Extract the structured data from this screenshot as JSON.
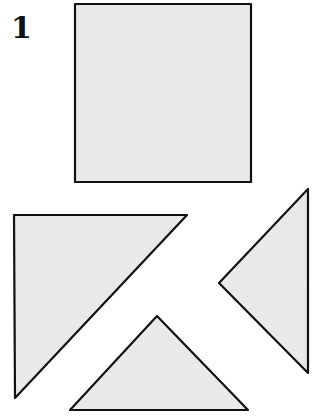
{
  "figure": {
    "label": "1",
    "fill_color": "#e9e9e9",
    "stroke_color": "#111111",
    "pieces": [
      {
        "name": "square",
        "points": "75,4 251,4 251,182 75,182"
      },
      {
        "name": "large-triangle",
        "points": "14,215 187,215 15,398"
      },
      {
        "name": "right-triangle",
        "points": "308,189 308,373 219,283"
      },
      {
        "name": "bottom-triangle",
        "points": "157,316 248,410 70,410"
      }
    ]
  }
}
